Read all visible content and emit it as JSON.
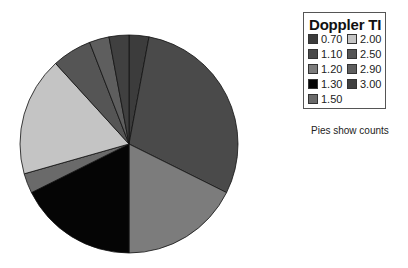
{
  "chart_data": {
    "type": "pie",
    "title": "",
    "legend_title": "Doppler TI",
    "legend_position": "right",
    "start_angle": "12 o'clock, clockwise",
    "categories": [
      "0.70",
      "1.10",
      "1.20",
      "1.30",
      "1.50",
      "2.00",
      "2.50",
      "2.90",
      "3.00"
    ],
    "values": [
      1,
      10,
      6,
      6,
      1,
      6,
      2,
      1,
      1
    ],
    "colors": [
      "#3c3c3c",
      "#4a4a4a",
      "#7c7c7c",
      "#050505",
      "#6a6a6a",
      "#c4c4c4",
      "#555555",
      "#5e5e5e",
      "#404040"
    ],
    "annotation": "Pies show counts"
  },
  "legend": {
    "title": "Doppler TI",
    "items": [
      {
        "label": "0.70"
      },
      {
        "label": "1.10"
      },
      {
        "label": "1.20"
      },
      {
        "label": "1.30"
      },
      {
        "label": "1.50"
      },
      {
        "label": "2.00"
      },
      {
        "label": "2.50"
      },
      {
        "label": "2.90"
      },
      {
        "label": "3.00"
      }
    ]
  },
  "note": "Pies show counts"
}
